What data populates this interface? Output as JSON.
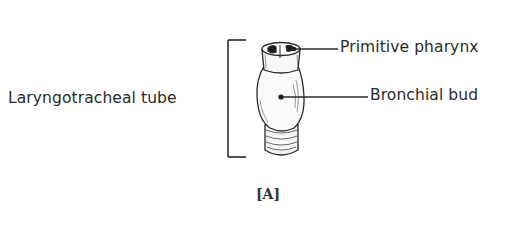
{
  "figure": {
    "caption": "[A]",
    "labels": {
      "left": "Laryngotracheal tube",
      "top_right": "Primitive pharynx",
      "middle_right": "Bronchial bud"
    },
    "colors": {
      "ink": "#2a2a2a",
      "background": "#ffffff"
    }
  }
}
